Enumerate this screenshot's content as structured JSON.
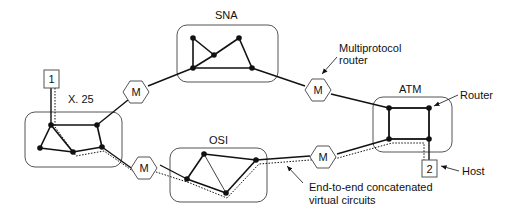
{
  "diagram": {
    "networks": [
      {
        "id": "sna",
        "label": "SNA"
      },
      {
        "id": "x25",
        "label": "X. 25"
      },
      {
        "id": "osi",
        "label": "OSI"
      },
      {
        "id": "atm",
        "label": "ATM"
      }
    ],
    "routers": [
      {
        "id": "m1",
        "label": "M"
      },
      {
        "id": "m2",
        "label": "M"
      },
      {
        "id": "m3",
        "label": "M"
      },
      {
        "id": "m4",
        "label": "M"
      }
    ],
    "hosts": [
      {
        "id": "host1",
        "label": "1"
      },
      {
        "id": "host2",
        "label": "2"
      }
    ],
    "annotations": {
      "multiprotocol_line1": "Multiprotocol",
      "multiprotocol_line2": "router",
      "router": "Router",
      "host": "Host",
      "vc_line1": "End-to-end concatenated",
      "vc_line2": "virtual circuits"
    },
    "colors": {
      "line": "#111111",
      "cloud": "#555555",
      "background": "#ffffff"
    }
  }
}
